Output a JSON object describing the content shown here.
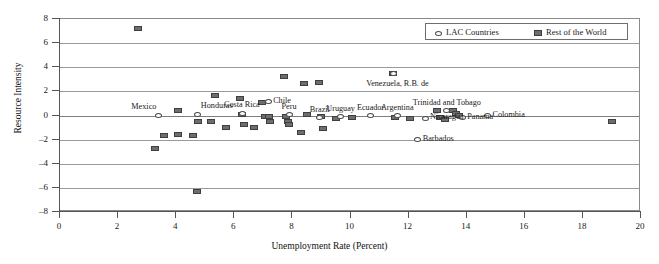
{
  "chart_data": {
    "type": "scatter",
    "title": "",
    "xlabel": "Unemployment Rate (Percent)",
    "ylabel": "Resource Intensity",
    "xlim": [
      0,
      20
    ],
    "ylim": [
      -8,
      8
    ],
    "xticks": [
      0,
      2,
      4,
      6,
      8,
      10,
      12,
      14,
      16,
      18,
      20
    ],
    "yticks": [
      8,
      6,
      4,
      2,
      0,
      -2,
      -4,
      -6,
      -8
    ],
    "grid": "horizontal",
    "legend_position": "top-right",
    "legend": [
      {
        "name": "LAC Countries",
        "marker": "open-ellipse",
        "color": "#ffffff"
      },
      {
        "name": "Rest of the World",
        "marker": "filled-square",
        "color": "#6d6d6d"
      }
    ],
    "series": [
      {
        "name": "Rest of the World",
        "marker": "filled-square",
        "color": "#6d6d6d",
        "points": [
          {
            "x": 2.72,
            "y": 7.1
          },
          {
            "x": 3.3,
            "y": -2.8
          },
          {
            "x": 3.62,
            "y": -1.78
          },
          {
            "x": 4.08,
            "y": -1.65
          },
          {
            "x": 4.1,
            "y": 0.3
          },
          {
            "x": 4.62,
            "y": -1.72
          },
          {
            "x": 4.75,
            "y": -6.35
          },
          {
            "x": 4.78,
            "y": -0.62
          },
          {
            "x": 5.22,
            "y": -0.58
          },
          {
            "x": 5.38,
            "y": 1.58
          },
          {
            "x": 5.76,
            "y": -1.05
          },
          {
            "x": 6.22,
            "y": 1.32
          },
          {
            "x": 6.3,
            "y": 0.02
          },
          {
            "x": 6.38,
            "y": -0.8
          },
          {
            "x": 6.72,
            "y": -1.08
          },
          {
            "x": 6.98,
            "y": 1.02
          },
          {
            "x": 7.08,
            "y": -0.18
          },
          {
            "x": 7.22,
            "y": -0.2
          },
          {
            "x": 7.28,
            "y": -0.62
          },
          {
            "x": 7.75,
            "y": 3.18
          },
          {
            "x": 7.8,
            "y": -0.2
          },
          {
            "x": 7.88,
            "y": -0.58
          },
          {
            "x": 7.92,
            "y": -0.86
          },
          {
            "x": 8.32,
            "y": -1.52
          },
          {
            "x": 8.42,
            "y": 2.6
          },
          {
            "x": 8.52,
            "y": 0.02
          },
          {
            "x": 8.95,
            "y": 2.66
          },
          {
            "x": 9.02,
            "y": -0.2
          },
          {
            "x": 9.08,
            "y": -1.12
          },
          {
            "x": 9.55,
            "y": -0.32
          },
          {
            "x": 10.1,
            "y": -0.22
          },
          {
            "x": 11.5,
            "y": 3.38
          },
          {
            "x": 11.58,
            "y": -0.28
          },
          {
            "x": 12.08,
            "y": -0.3
          },
          {
            "x": 13.02,
            "y": 0.32
          },
          {
            "x": 13.1,
            "y": -0.22
          },
          {
            "x": 13.28,
            "y": -0.42
          },
          {
            "x": 13.55,
            "y": 0.3
          },
          {
            "x": 13.68,
            "y": 0.08
          },
          {
            "x": 13.78,
            "y": -0.1
          },
          {
            "x": 19.02,
            "y": -0.62
          }
        ]
      },
      {
        "name": "LAC Countries",
        "marker": "open-ellipse",
        "color": "#ffffff",
        "points": [
          {
            "x": 3.42,
            "y": -0.05,
            "label": "Mexico",
            "label_pos": "above-left"
          },
          {
            "x": 4.78,
            "y": 0.02,
            "label": "Honduras",
            "label_pos": "above-right"
          },
          {
            "x": 6.3,
            "y": 0.1,
            "label": "Costa Rica",
            "label_pos": "above"
          },
          {
            "x": 7.2,
            "y": 1.05,
            "label": "Chile",
            "label_pos": "right"
          },
          {
            "x": 7.92,
            "y": -0.02,
            "label": "Peru",
            "label_pos": "above"
          },
          {
            "x": 8.98,
            "y": -0.25,
            "label": "Brazil",
            "label_pos": "above"
          },
          {
            "x": 9.7,
            "y": -0.18,
            "label": "Uruguay",
            "label_pos": "above"
          },
          {
            "x": 10.72,
            "y": -0.12,
            "label": "Ecuador",
            "label_pos": "above"
          },
          {
            "x": 11.65,
            "y": -0.12,
            "label": "Argentina",
            "label_pos": "above"
          },
          {
            "x": 12.35,
            "y": -2.1,
            "label": "Barbados",
            "label_pos": "right"
          },
          {
            "x": 12.6,
            "y": -0.32,
            "label": "Nicaragua",
            "label_pos": "right"
          },
          {
            "x": 13.35,
            "y": 0.3,
            "label": "Trinidad and Tobago",
            "label_pos": "above"
          },
          {
            "x": 13.88,
            "y": -0.28,
            "label": "Panama",
            "label_pos": "right"
          },
          {
            "x": 14.75,
            "y": -0.1,
            "label": "Colombia",
            "label_pos": "right"
          },
          {
            "x": 11.52,
            "y": 3.38,
            "label": "Venezuela, R.B. de",
            "label_pos": "below-left"
          }
        ]
      }
    ]
  }
}
